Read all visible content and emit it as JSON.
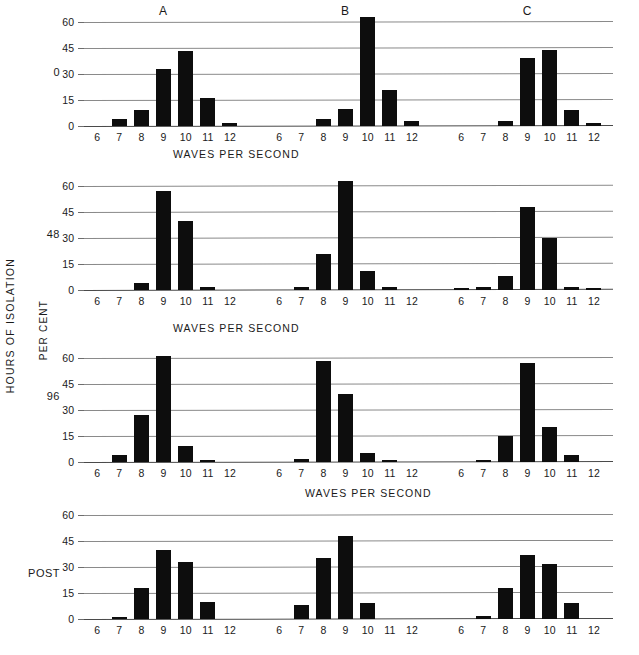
{
  "axis": {
    "y_label": "PER CENT",
    "row_group_label": "HOURS OF ISOLATION",
    "x_title": "WAVES PER SECOND",
    "y_ticks": [
      "0",
      "15",
      "30",
      "45",
      "60"
    ],
    "x_ticks": [
      "6",
      "7",
      "8",
      "9",
      "10",
      "11",
      "12"
    ]
  },
  "group_titles": [
    {
      "label": "A"
    },
    {
      "label": "B"
    },
    {
      "label": "C"
    }
  ],
  "rows": [
    {
      "label": "0"
    },
    {
      "label": "48"
    },
    {
      "label": "96"
    },
    {
      "label": "POST"
    }
  ],
  "chart_data": {
    "type": "bar",
    "title": "",
    "xlabel": "WAVES PER SECOND",
    "ylabel": "PER CENT",
    "ylim": [
      0,
      60
    ],
    "y_ticks": [
      0,
      15,
      30,
      45,
      60
    ],
    "categories": [
      6,
      7,
      8,
      9,
      10,
      11,
      12
    ],
    "grid": true,
    "legend": "none",
    "row_variable": "HOURS OF ISOLATION",
    "column_variable": "subject",
    "panels": [
      {
        "row": "0",
        "column": "A",
        "values": [
          0,
          4,
          9,
          33,
          43,
          16,
          2
        ]
      },
      {
        "row": "0",
        "column": "B",
        "values": [
          0,
          0,
          4,
          10,
          63,
          21,
          3
        ]
      },
      {
        "row": "0",
        "column": "C",
        "values": [
          0,
          0,
          3,
          39,
          44,
          9,
          2
        ]
      },
      {
        "row": "48",
        "column": "A",
        "values": [
          0,
          0,
          4,
          57,
          40,
          2,
          0
        ]
      },
      {
        "row": "48",
        "column": "B",
        "values": [
          0,
          1.5,
          21,
          63,
          11,
          2,
          0
        ]
      },
      {
        "row": "48",
        "column": "C",
        "values": [
          1,
          2,
          8,
          48,
          30,
          2,
          1
        ]
      },
      {
        "row": "96",
        "column": "A",
        "values": [
          0,
          4,
          27,
          61,
          9,
          1,
          0
        ]
      },
      {
        "row": "96",
        "column": "B",
        "values": [
          0,
          2,
          58,
          39,
          5,
          1,
          0
        ]
      },
      {
        "row": "96",
        "column": "C",
        "values": [
          0,
          1,
          15,
          57,
          20,
          4,
          0
        ]
      },
      {
        "row": "POST",
        "column": "A",
        "values": [
          0,
          1,
          18,
          40,
          33,
          10,
          0
        ]
      },
      {
        "row": "POST",
        "column": "B",
        "values": [
          0,
          8,
          35,
          48,
          9,
          0,
          0
        ]
      },
      {
        "row": "POST",
        "column": "C",
        "values": [
          0,
          2,
          18,
          37,
          32,
          9,
          0
        ]
      }
    ]
  }
}
